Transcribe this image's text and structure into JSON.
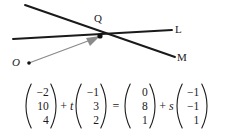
{
  "diagram": {
    "labels": {
      "intersection": "Q",
      "line_l": "L",
      "line_m": "M",
      "origin": "O"
    },
    "colors": {
      "line": "#1a1a1a",
      "vector_arrow": "#808080",
      "point": "#111111",
      "background": "#ffffff"
    },
    "points": {
      "Q": {
        "x": 100,
        "y": 36
      },
      "O": {
        "x": 29,
        "y": 63
      }
    },
    "lines": [
      {
        "name": "L",
        "from": {
          "x": 13,
          "y": 39
        },
        "to": {
          "x": 172,
          "y": 30
        }
      },
      {
        "name": "M",
        "from": {
          "x": 25,
          "y": 5
        },
        "to": {
          "x": 175,
          "y": 57
        }
      }
    ],
    "arrow": {
      "name": "position-vector-OQ",
      "from": {
        "x": 29,
        "y": 63
      },
      "to": {
        "x": 100,
        "y": 36
      }
    }
  },
  "equation": {
    "terms": [
      {
        "kind": "vector",
        "name": "point-a",
        "entries": [
          "−2",
          "10",
          "4"
        ]
      },
      {
        "kind": "operator",
        "name": "plus-1",
        "text": "+"
      },
      {
        "kind": "scalar",
        "name": "parameter-t",
        "text": "t"
      },
      {
        "kind": "vector",
        "name": "direction-l",
        "entries": [
          "−1",
          "3",
          "2"
        ]
      },
      {
        "kind": "operator",
        "name": "equals",
        "text": "="
      },
      {
        "kind": "vector",
        "name": "point-b",
        "entries": [
          "0",
          "8",
          "1"
        ]
      },
      {
        "kind": "operator",
        "name": "plus-2",
        "text": "+"
      },
      {
        "kind": "scalar",
        "name": "parameter-s",
        "text": "s"
      },
      {
        "kind": "vector",
        "name": "direction-m",
        "entries": [
          "−1",
          "−1",
          "1"
        ]
      }
    ]
  }
}
